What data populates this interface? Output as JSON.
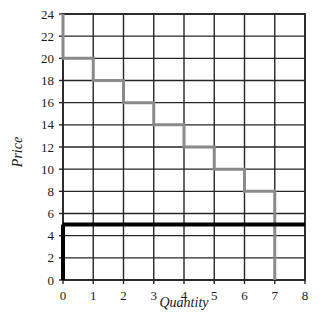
{
  "chart_data": {
    "type": "line",
    "title": "",
    "xlabel": "Quantity",
    "ylabel": "Price",
    "xlim": [
      0,
      8
    ],
    "ylim": [
      0,
      24
    ],
    "xticks": [
      "0",
      "1",
      "2",
      "3",
      "4",
      "5",
      "6",
      "7",
      "8"
    ],
    "yticks": [
      "0",
      "2",
      "4",
      "6",
      "8",
      "10",
      "12",
      "14",
      "16",
      "18",
      "20",
      "22",
      "24"
    ],
    "grid": true,
    "legend": "none",
    "series": [
      {
        "name": "demand-step-curve",
        "style": "step",
        "color": "#8a8a8a",
        "linewidth": 3,
        "points": [
          {
            "x": 0,
            "y": 24
          },
          {
            "x": 0,
            "y": 20
          },
          {
            "x": 1,
            "y": 20
          },
          {
            "x": 1,
            "y": 18
          },
          {
            "x": 2,
            "y": 18
          },
          {
            "x": 2,
            "y": 16
          },
          {
            "x": 3,
            "y": 16
          },
          {
            "x": 3,
            "y": 14
          },
          {
            "x": 4,
            "y": 14
          },
          {
            "x": 4,
            "y": 12
          },
          {
            "x": 5,
            "y": 12
          },
          {
            "x": 5,
            "y": 10
          },
          {
            "x": 6,
            "y": 10
          },
          {
            "x": 6,
            "y": 8
          },
          {
            "x": 7,
            "y": 8
          },
          {
            "x": 7,
            "y": 0
          }
        ],
        "step_values": [
          {
            "quantity_interval": "0-1",
            "price": 20
          },
          {
            "quantity_interval": "1-2",
            "price": 18
          },
          {
            "quantity_interval": "2-3",
            "price": 16
          },
          {
            "quantity_interval": "3-4",
            "price": 14
          },
          {
            "quantity_interval": "4-5",
            "price": 12
          },
          {
            "quantity_interval": "5-6",
            "price": 10
          },
          {
            "quantity_interval": "6-7",
            "price": 8
          }
        ]
      },
      {
        "name": "price-line",
        "style": "horizontal-line",
        "color": "#000000",
        "linewidth": 4,
        "y": 5,
        "x_from": 0,
        "x_to": 8
      },
      {
        "name": "left-axis-highlight",
        "style": "vertical-line",
        "color": "#000000",
        "linewidth": 4,
        "x": 0,
        "y_from": 0,
        "y_to": 5
      }
    ]
  },
  "axes": {
    "ylabel": "Price",
    "xlabel": "Quantity",
    "x_tick_labels": [
      "0",
      "1",
      "2",
      "3",
      "4",
      "5",
      "6",
      "7",
      "8"
    ],
    "y_tick_labels": [
      "0",
      "2",
      "4",
      "6",
      "8",
      "10",
      "12",
      "14",
      "16",
      "18",
      "20",
      "22",
      "24"
    ]
  },
  "colors": {
    "grid": "#262626",
    "curve": "#8a8a8a",
    "emphasis": "#000000",
    "background": "#ffffff",
    "text": "#1a1a1a"
  }
}
